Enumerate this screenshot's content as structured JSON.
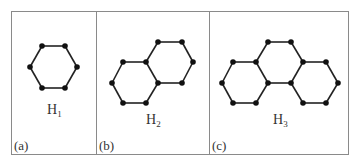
{
  "figure": {
    "panels": [
      {
        "id": "a",
        "tag": "(a)",
        "name": "H",
        "subscript": "1",
        "hexagons": 1,
        "vertices": [
          [
            42,
            46
          ],
          [
            65,
            46
          ],
          [
            30,
            67
          ],
          [
            77,
            67
          ],
          [
            42,
            88
          ],
          [
            65,
            88
          ]
        ],
        "edges": [
          [
            0,
            1
          ],
          [
            0,
            2
          ],
          [
            1,
            3
          ],
          [
            2,
            4
          ],
          [
            3,
            5
          ],
          [
            4,
            5
          ]
        ]
      },
      {
        "id": "b",
        "tag": "(b)",
        "name": "H",
        "subscript": "2",
        "hexagons": 2,
        "vertices": [
          [
            158,
            42
          ],
          [
            182,
            42
          ],
          [
            123,
            62
          ],
          [
            146,
            62
          ],
          [
            193,
            62
          ],
          [
            112,
            83
          ],
          [
            158,
            83
          ],
          [
            182,
            83
          ],
          [
            123,
            103
          ],
          [
            146,
            103
          ]
        ],
        "edges": [
          [
            0,
            1
          ],
          [
            0,
            3
          ],
          [
            1,
            4
          ],
          [
            2,
            3
          ],
          [
            2,
            5
          ],
          [
            3,
            6
          ],
          [
            4,
            7
          ],
          [
            6,
            7
          ],
          [
            5,
            8
          ],
          [
            6,
            9
          ],
          [
            8,
            9
          ]
        ]
      },
      {
        "id": "c",
        "tag": "(c)",
        "name": "H",
        "subscript": "3",
        "hexagons": 3,
        "vertices": [
          [
            268,
            42
          ],
          [
            291,
            42
          ],
          [
            233,
            62
          ],
          [
            256,
            62
          ],
          [
            303,
            62
          ],
          [
            326,
            62
          ],
          [
            222,
            83
          ],
          [
            268,
            83
          ],
          [
            291,
            83
          ],
          [
            338,
            83
          ],
          [
            233,
            103
          ],
          [
            256,
            103
          ],
          [
            303,
            103
          ],
          [
            326,
            103
          ]
        ],
        "edges": [
          [
            0,
            1
          ],
          [
            0,
            3
          ],
          [
            1,
            4
          ],
          [
            2,
            3
          ],
          [
            4,
            5
          ],
          [
            2,
            6
          ],
          [
            3,
            7
          ],
          [
            4,
            8
          ],
          [
            5,
            9
          ],
          [
            7,
            8
          ],
          [
            6,
            10
          ],
          [
            7,
            11
          ],
          [
            8,
            12
          ],
          [
            9,
            13
          ],
          [
            10,
            11
          ],
          [
            12,
            13
          ]
        ]
      }
    ],
    "colors": {
      "border": "#8a8a8a",
      "edge": "#222222",
      "vertex": "#111111",
      "text": "#333333"
    }
  }
}
